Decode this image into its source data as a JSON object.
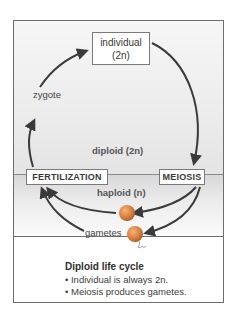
{
  "diagram": {
    "title": "Diploid life cycle",
    "nodes": {
      "individual": {
        "line1": "individual",
        "line2": "(2n)"
      },
      "fertilization": "FERTILIZATION",
      "meiosis": "MEIOSIS"
    },
    "labels": {
      "zygote": "zygote",
      "gametes": "gametes",
      "diploid": "diploid (2n)",
      "haploid": "haploid (n)"
    },
    "caption": {
      "title": "Diploid life cycle",
      "bullets": [
        "• Individual is always 2n.",
        "• Meiosis produces gametes."
      ]
    },
    "colors": {
      "arrow": "#3a3a3a",
      "gamete": "#d9803f",
      "frame_border": "#6e6e6e"
    }
  }
}
